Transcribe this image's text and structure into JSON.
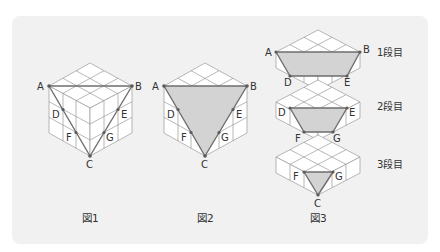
{
  "colors": {
    "panel_bg": "#f1f1f1",
    "section_fill": "#d3d3d3",
    "cut_line": "#6e6e6e",
    "grid_line": "#9a9a9a",
    "point": "#5a5a5a",
    "text": "#333333"
  },
  "figures": [
    {
      "caption": "図1",
      "points": {
        "A": "A",
        "B": "B",
        "C": "C",
        "D": "D",
        "E": "E",
        "F": "F",
        "G": "G"
      },
      "section_shaded": false
    },
    {
      "caption": "図2",
      "points": {
        "A": "A",
        "B": "B",
        "C": "C",
        "D": "D",
        "E": "E",
        "F": "F",
        "G": "G"
      },
      "section_shaded": true
    },
    {
      "caption": "図3",
      "layers": [
        {
          "label": "1段目",
          "points": [
            "A",
            "B",
            "D",
            "E"
          ]
        },
        {
          "label": "2段目",
          "points": [
            "D",
            "E",
            "F",
            "G"
          ]
        },
        {
          "label": "3段目",
          "points": [
            "F",
            "G",
            "C"
          ]
        }
      ]
    }
  ],
  "labels": {
    "A": "A",
    "B": "B",
    "C": "C",
    "D": "D",
    "E": "E",
    "F": "F",
    "G": "G"
  }
}
